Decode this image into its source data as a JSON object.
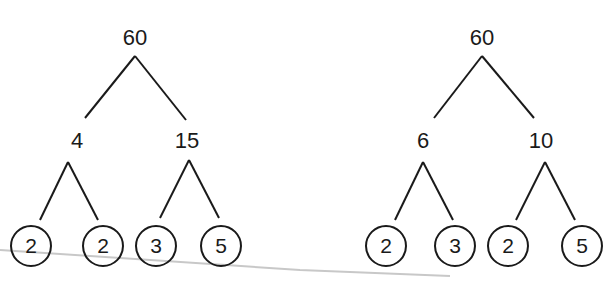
{
  "trees": [
    {
      "root": "60",
      "children": [
        {
          "value": "4",
          "leaves": [
            "2",
            "2"
          ]
        },
        {
          "value": "15",
          "leaves": [
            "3",
            "5"
          ]
        }
      ]
    },
    {
      "root": "60",
      "children": [
        {
          "value": "6",
          "leaves": [
            "2",
            "3"
          ]
        },
        {
          "value": "10",
          "leaves": [
            "2",
            "5"
          ]
        }
      ]
    }
  ],
  "colors": {
    "ink": "#1a1a1a",
    "stray_line": "#c8c8c8"
  }
}
